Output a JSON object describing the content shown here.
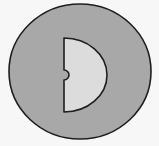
{
  "diagram": {
    "colors": {
      "background": "#f7f7f7",
      "outer_circle_fill": "#a8a8a8",
      "inner_shape_fill": "#dcdcdc",
      "stroke": "#1e1e1e"
    }
  }
}
